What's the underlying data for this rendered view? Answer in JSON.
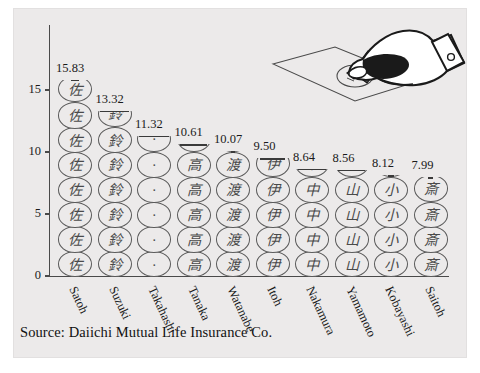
{
  "caption": "Source: Daiichi Mutual Life Insurance Co.",
  "axis": {
    "y_ticks": [
      "0",
      "5",
      "10",
      "15"
    ],
    "y_tick_values": [
      0,
      5,
      10,
      15
    ],
    "y_min": 0,
    "y_max": 16.5
  },
  "illustration": {
    "hand_name": "hand-holding-hanko",
    "paper_name": "paper-sheet",
    "seal_name": "stamped-seal-mark"
  },
  "chart_data": {
    "type": "bar",
    "title": "",
    "subtitle": "",
    "xlabel": "",
    "ylabel": "",
    "ylim": [
      0,
      16.5
    ],
    "y_ticks": [
      0,
      5,
      10,
      15
    ],
    "grid": false,
    "legend": null,
    "unit_per_symbol": 2,
    "symbol": "hanko-seal-circle",
    "categories": [
      "Satoh",
      "Suzuki",
      "Takahashi",
      "Tanaka",
      "Watanabe",
      "Itoh",
      "Nakamura",
      "Yamamoto",
      "Kobayashi",
      "Saitoh"
    ],
    "values": [
      15.83,
      13.32,
      11.32,
      10.61,
      10.07,
      9.5,
      8.64,
      8.56,
      8.12,
      7.99
    ],
    "data_labels": [
      "15.83",
      "13.32",
      "11.32",
      "10.61",
      "10.07",
      "9.50",
      "8.64",
      "8.56",
      "8.12",
      "7.99"
    ],
    "glyphs": [
      "佐",
      "鈴",
      "·",
      "高",
      "渡",
      "伊",
      "中",
      "山",
      "小",
      "斎"
    ]
  }
}
